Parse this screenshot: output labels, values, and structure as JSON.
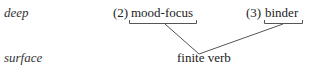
{
  "levels": {
    "deep": "deep",
    "surface": "surface"
  },
  "deep_items": [
    {
      "number": "(2)",
      "label": "mood-focus"
    },
    {
      "number": "(3)",
      "label": "binder"
    }
  ],
  "surface_item": {
    "label": "finite verb"
  },
  "colors": {
    "line": "#555555",
    "text": "#222222"
  }
}
